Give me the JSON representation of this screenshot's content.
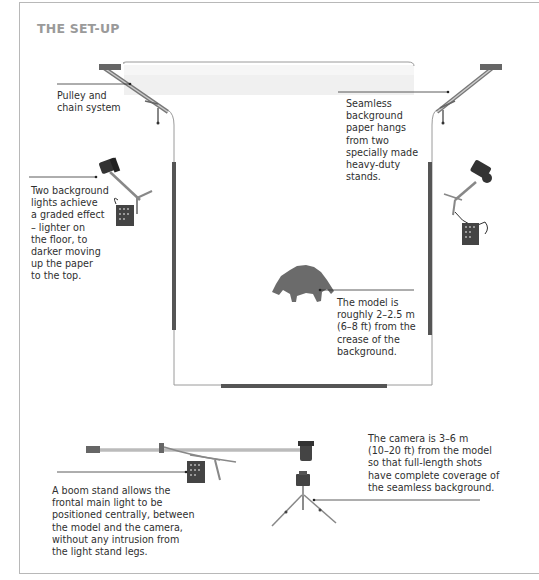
{
  "title": "THE SET-UP",
  "labels": {
    "pulley": [
      "Pulley and",
      "chain system"
    ],
    "seamless": [
      "Seamless",
      "background",
      "paper hangs",
      "from two",
      "specially made",
      "heavy-duty",
      "stands."
    ],
    "background_lights": [
      "Two background",
      "lights achieve",
      "a graded effect",
      "– lighter on",
      "the floor, to",
      "darker moving",
      "up the paper",
      "to the top."
    ],
    "model": [
      "The model is",
      "roughly 2–2.5 m",
      "(6–8 ft) from the",
      "crease of the",
      "background."
    ],
    "boom": [
      "A boom stand allows the",
      "frontal main light to be",
      "positioned centrally, between",
      "the model and the camera,",
      "without any intrusion from",
      "the light stand legs."
    ],
    "camera": [
      "The camera is 3–6 m",
      "(10–20 ft) from the model",
      "so that full-length shots",
      "have complete coverage of",
      "the seamless background."
    ]
  },
  "icons": {
    "left_stand": "background-stand-icon",
    "right_stand": "background-stand-icon",
    "left_light": "background-light-icon",
    "right_light": "background-light-icon",
    "model": "model-silhouette-icon",
    "boom_light": "boom-light-icon",
    "camera": "camera-tripod-icon"
  },
  "colors": {
    "frame": "#b8b8b8",
    "title": "#9a9a9a",
    "text": "#2f2f2f",
    "stand_bar": "#555555",
    "paper_line": "#9a9a9a",
    "leader": "#333333",
    "silhouette": "#6b6b6b"
  }
}
